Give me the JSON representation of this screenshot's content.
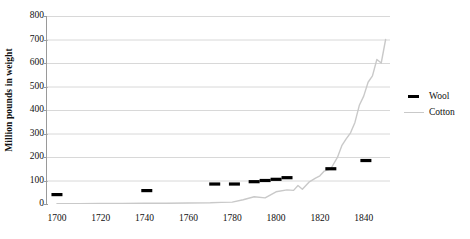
{
  "chart_data": {
    "type": "line",
    "title": "",
    "xlabel": "",
    "ylabel": "Million pounds in weight",
    "xlim": [
      1695,
      1852
    ],
    "ylim": [
      0,
      800
    ],
    "grid": true,
    "legend_position": "right",
    "y_ticks": [
      800,
      700,
      600,
      500,
      400,
      300,
      200,
      100,
      0
    ],
    "x_ticks": [
      1700,
      1720,
      1740,
      1760,
      1780,
      1800,
      1820,
      1840
    ],
    "series": [
      {
        "name": "Wool",
        "style": "markers",
        "color": "#000000",
        "x": [
          1700,
          1741,
          1772,
          1781,
          1790,
          1795,
          1800,
          1805,
          1825,
          1841
        ],
        "values": [
          40,
          57,
          85,
          85,
          95,
          100,
          105,
          112,
          150,
          185
        ]
      },
      {
        "name": "Cotton",
        "style": "line",
        "color": "#c9c9c9",
        "x": [
          1700,
          1710,
          1720,
          1730,
          1740,
          1750,
          1760,
          1770,
          1775,
          1780,
          1785,
          1790,
          1795,
          1800,
          1805,
          1808,
          1810,
          1812,
          1815,
          1818,
          1820,
          1822,
          1825,
          1828,
          1830,
          1832,
          1834,
          1836,
          1838,
          1840,
          1842,
          1844,
          1846,
          1848,
          1850
        ],
        "values": [
          1,
          1,
          2,
          2,
          3,
          3,
          4,
          5,
          7,
          8,
          18,
          31,
          26,
          52,
          60,
          58,
          79,
          63,
          93,
          110,
          120,
          140,
          150,
          198,
          248,
          277,
          303,
          347,
          420,
          459,
          518,
          545,
          615,
          600,
          700
        ]
      }
    ],
    "legend": [
      {
        "label": "Wool",
        "key": "wool-dash-key",
        "color": "#000000"
      },
      {
        "label": "Cotton",
        "key": "cotton-line-key",
        "color": "#c9c9c9"
      }
    ]
  },
  "axis": {
    "y_title": "Million pounds in weight",
    "y_tick_labels": [
      "800",
      "700",
      "600",
      "500",
      "400",
      "300",
      "200",
      "100",
      "0"
    ],
    "x_tick_labels": [
      "1700",
      "1720",
      "1740",
      "1760",
      "1780",
      "1800",
      "1820",
      "1840"
    ]
  },
  "colors": {
    "wool": "#000000",
    "cotton": "#c9c9c9",
    "gridline": "#d8d8d8",
    "axis": "#9a9a9a",
    "text": "#101010",
    "background": "#ffffff"
  }
}
